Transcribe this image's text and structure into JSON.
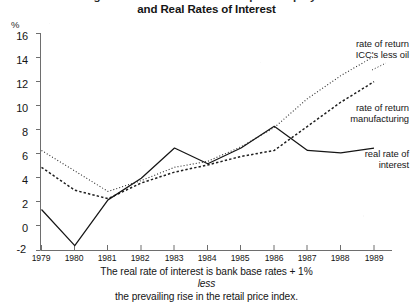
{
  "title": {
    "line1": "Figure 3  Rates of Return on Capital Employed",
    "line2": "and Real Rates of Interest"
  },
  "axes": {
    "y_unit": "%",
    "y_ticks": [
      "16",
      "14",
      "12",
      "10",
      "8",
      "6",
      "4",
      "2",
      "0",
      "-2"
    ],
    "x_ticks": [
      "1979",
      "1980",
      "1981",
      "1982",
      "1983",
      "1984",
      "1985",
      "1986",
      "1987",
      "1988",
      "1989"
    ]
  },
  "legend": {
    "icc_line1": "rate of return",
    "icc_line2": "ICC's less oil",
    "mfg_line1": "rate of return",
    "mfg_line2": "manufacturing",
    "real_line1": "real rate of",
    "real_line2": "interest"
  },
  "footnote": {
    "line1_a": "The real rate of interest is bank base rates + 1% ",
    "line1_b": "less",
    "line2": "the prevailing rise in the retail price index."
  },
  "colors": {
    "ink": "#151515",
    "axis": "#6e6e6e",
    "background": "#ffffff"
  },
  "chart_data": {
    "type": "line",
    "title": "Figure 3  Rates of Return on Capital Employed and Real Rates of Interest",
    "xlabel": "",
    "ylabel": "%",
    "xlim": [
      1979,
      1989
    ],
    "ylim": [
      -2,
      16
    ],
    "grid": false,
    "legend_position": "inline-right",
    "x": [
      1979,
      1980,
      1981,
      1982,
      1983,
      1984,
      1985,
      1986,
      1987,
      1988,
      1989
    ],
    "series": [
      {
        "name": "rate of return ICC's less oil",
        "style": "dotted",
        "values": [
          6.3,
          4.6,
          2.9,
          3.8,
          4.9,
          5.4,
          6.6,
          8.2,
          10.6,
          12.5,
          14.1
        ]
      },
      {
        "name": "rate of return manufacturing",
        "style": "dashed",
        "values": [
          4.9,
          3.0,
          2.3,
          3.6,
          4.5,
          5.1,
          5.8,
          6.3,
          8.3,
          10.3,
          12.0
        ]
      },
      {
        "name": "real rate of interest",
        "style": "solid",
        "values": [
          1.4,
          -1.6,
          2.2,
          4.0,
          6.5,
          5.2,
          6.5,
          8.3,
          6.3,
          6.1,
          6.5
        ]
      }
    ],
    "annotations": [
      "The real rate of interest is bank base rates + 1% less the prevailing rise in the retail price index."
    ]
  }
}
